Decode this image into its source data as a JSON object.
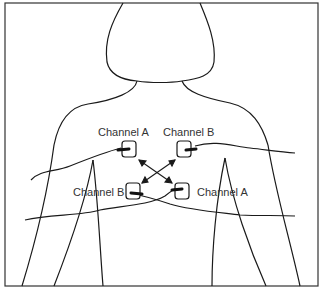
{
  "figure": {
    "labels": {
      "top_left": "Channel A",
      "top_right": "Channel B",
      "bottom_left": "Channel B",
      "bottom_right": "Channel A"
    },
    "colors": {
      "line": "#1a1a1a",
      "frame": "#333333",
      "text": "#333333",
      "background": "#ffffff"
    }
  }
}
